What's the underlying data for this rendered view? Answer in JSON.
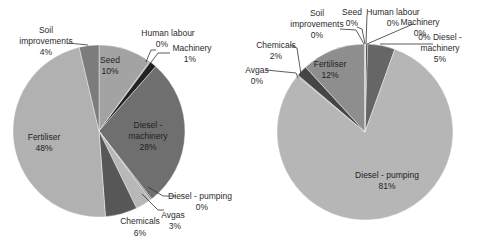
{
  "chart_data": [
    {
      "type": "pie",
      "title": "",
      "center": [
        99,
        131
      ],
      "radius": 86,
      "start_angle_deg": 0,
      "direction": "clockwise",
      "slices": [
        {
          "label": "Seed",
          "value": 10,
          "display": "10%",
          "color": "#a3a3a3",
          "label_pos": [
            110,
            63
          ],
          "inside": true
        },
        {
          "label": "Human labour",
          "value": 0.2,
          "display": "0%",
          "color": "#909090",
          "label_pos": [
            168,
            36
          ],
          "pct_pos": [
            162,
            47
          ],
          "inside": false,
          "leader": [
            [
              146,
              62
            ],
            [
              151,
              50
            ],
            [
              156,
              50
            ]
          ]
        },
        {
          "label": "Machinery",
          "value": 1.3,
          "display": "1%",
          "color": "#222222",
          "label_pos": [
            192,
            51
          ],
          "pct_pos": [
            190,
            62
          ],
          "inside": false,
          "leader": [
            [
              149,
              65
            ],
            [
              158,
              53
            ],
            [
              170,
              53
            ]
          ]
        },
        {
          "label": "Diesel - machinery",
          "value": 28,
          "display": "28%",
          "color": "#6f6f6f",
          "label_pos": [
            148,
            128
          ],
          "inside": true,
          "multiline": [
            "Diesel -",
            "machinery",
            "28%"
          ]
        },
        {
          "label": "Diesel - pumping",
          "value": 0.3,
          "display": "0%",
          "color": "#808080",
          "label_pos": [
            200,
            199
          ],
          "pct_pos": [
            202,
            210
          ],
          "inside": false,
          "leader": [
            [
              148,
              187
            ],
            [
              163,
              196
            ],
            [
              176,
              196
            ]
          ]
        },
        {
          "label": "Avgas",
          "value": 3,
          "display": "3%",
          "color": "#b8b8b8",
          "label_pos": [
            173,
            218
          ],
          "pct_pos": [
            175,
            229
          ],
          "inside": false,
          "leader": [
            [
              142,
              194
            ],
            [
              158,
              210
            ],
            [
              164,
              210
            ]
          ]
        },
        {
          "label": "Chemicals",
          "value": 6,
          "display": "6%",
          "color": "#575757",
          "label_pos": [
            140,
            224
          ],
          "pct_pos": [
            140,
            236
          ],
          "inside": false
        },
        {
          "label": "Fertiliser",
          "value": 47.5,
          "display": "48%",
          "color": "#b1b1b1",
          "label_pos": [
            44,
            140
          ],
          "inside": true,
          "multiline": [
            "Fertiliser",
            "48%"
          ]
        },
        {
          "label": "Soil improvements",
          "value": 3.7,
          "display": "4%",
          "color": "#7c7c7c",
          "label_pos": [
            46,
            33
          ],
          "inside": false,
          "multiline": [
            "Soil",
            "improvements",
            "4%"
          ],
          "leader": [
            [
              68,
              43
            ],
            [
              88,
              45
            ]
          ]
        }
      ]
    },
    {
      "type": "pie",
      "title": "",
      "center": [
        365,
        132
      ],
      "radius": 88,
      "start_angle_deg": 0,
      "direction": "clockwise",
      "slices": [
        {
          "label": "Seed",
          "value": 0.1,
          "display": "0%",
          "color": "#999999",
          "label_pos": [
            352,
            15
          ],
          "inside": false,
          "multiline": [
            "Seed",
            "0%"
          ],
          "leader": [
            [
              357,
              27
            ],
            [
              362,
              29
            ],
            [
              365,
              44
            ]
          ]
        },
        {
          "label": "Human labour",
          "value": 0.1,
          "display": "0%",
          "color": "#888888",
          "label_pos": [
            393,
            15
          ],
          "inside": false,
          "multiline": [
            "Human labour",
            "0%"
          ],
          "leader": [
            [
              367,
              15
            ],
            [
              366,
              44
            ]
          ]
        },
        {
          "label": "Machinery",
          "value": 0.3,
          "display": "0%",
          "color": "#1a1a1a",
          "label_pos": [
            420,
            25
          ],
          "inside": false,
          "leader": [
            [
              413,
              24
            ],
            [
              367,
              44
            ]
          ]
        },
        {
          "label": "Diesel - machinery",
          "value": 5,
          "display": "5%",
          "color": "#666666",
          "label_pos": [
            440,
            40
          ],
          "inside": false,
          "multiline": [
            "0% Diesel -",
            "machinery",
            "5%"
          ],
          "leader": [
            [
              380,
              44
            ],
            [
              433,
              44
            ]
          ]
        },
        {
          "label": "Diesel - pumping",
          "value": 80.5,
          "display": "81%",
          "color": "#b6b6b6",
          "label_pos": [
            387,
            178
          ],
          "inside": true,
          "multiline": [
            "Diesel - pumping",
            "81%"
          ]
        },
        {
          "label": "Avgas",
          "value": 0.2,
          "display": "0%",
          "color": "#9a9a9a",
          "label_pos": [
            257,
            73
          ],
          "inside": false,
          "multiline": [
            "Avgas",
            "0%"
          ],
          "leader": [
            [
              266,
              70
            ],
            [
              296,
              73
            ],
            [
              298,
              78
            ]
          ]
        },
        {
          "label": "Chemicals",
          "value": 2,
          "display": "2%",
          "color": "#454545",
          "label_pos": [
            276,
            48
          ],
          "inside": false,
          "multiline": [
            "Chemicals",
            "2%"
          ],
          "leader": [
            [
              290,
              45
            ],
            [
              297,
              48
            ],
            [
              301,
              74
            ]
          ]
        },
        {
          "label": "Fertiliser",
          "value": 11.7,
          "display": "12%",
          "color": "#8e8e8e",
          "label_pos": [
            330,
            67
          ],
          "inside": true,
          "multiline": [
            "Fertiliser",
            "12%"
          ]
        },
        {
          "label": "Soil improvements",
          "value": 0.1,
          "display": "0%",
          "color": "#7a7a7a",
          "label_pos": [
            317,
            16
          ],
          "inside": false,
          "multiline": [
            "Soil",
            "improvements",
            "0%"
          ],
          "leader": [
            [
              340,
              29
            ],
            [
              356,
              30
            ],
            [
              364,
              44
            ]
          ]
        }
      ]
    }
  ]
}
